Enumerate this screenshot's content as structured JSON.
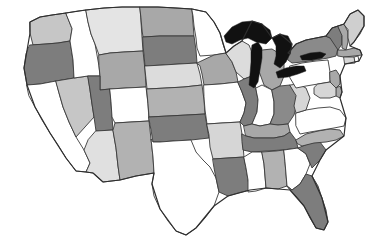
{
  "figure": {
    "background_color": "#ffffff",
    "border_color": "#3a3a3a"
  },
  "legend": {
    "shown": false,
    "shade_levels": [
      {
        "name": "white",
        "color": "#ffffff"
      },
      {
        "name": "light-gray",
        "color": "#e4e4e4"
      },
      {
        "name": "medium-light-gray",
        "color": "#c6c6c6"
      },
      {
        "name": "medium-gray",
        "color": "#a8a8a8"
      },
      {
        "name": "dark-gray",
        "color": "#7d7d7d"
      },
      {
        "name": "black",
        "color": "#111111"
      }
    ]
  },
  "chart_data": {
    "type": "choropleth",
    "subtitle": "",
    "xlabel": "",
    "ylabel": "",
    "grid": false,
    "legend_position": "none",
    "region_field": "state",
    "value_field": "shade",
    "categories": [
      "WA",
      "OR",
      "CA",
      "NV",
      "ID",
      "MT",
      "WY",
      "UT",
      "AZ",
      "CO",
      "NM",
      "ND",
      "SD",
      "NE",
      "KS",
      "OK",
      "TX",
      "MN",
      "IA",
      "MO",
      "AR",
      "LA",
      "WI",
      "IL",
      "MI",
      "IN",
      "OH",
      "KY",
      "TN",
      "MS",
      "AL",
      "GA",
      "FL",
      "SC",
      "NC",
      "VA",
      "WV",
      "PA",
      "NY",
      "VT",
      "NH",
      "ME",
      "MA",
      "RI",
      "CT",
      "NJ",
      "DE",
      "MD"
    ],
    "states": [
      {
        "code": "WA",
        "name": "Washington",
        "shade": "medium-light-gray",
        "color": "#c6c6c6"
      },
      {
        "code": "OR",
        "name": "Oregon",
        "shade": "dark-gray",
        "color": "#7d7d7d"
      },
      {
        "code": "CA",
        "name": "California",
        "shade": "white",
        "color": "#ffffff"
      },
      {
        "code": "NV",
        "name": "Nevada",
        "shade": "medium-light-gray",
        "color": "#c6c6c6"
      },
      {
        "code": "ID",
        "name": "Idaho",
        "shade": "white",
        "color": "#ffffff"
      },
      {
        "code": "MT",
        "name": "Montana",
        "shade": "light-gray",
        "color": "#e4e4e4"
      },
      {
        "code": "WY",
        "name": "Wyoming",
        "shade": "medium-gray",
        "color": "#a8a8a8"
      },
      {
        "code": "UT",
        "name": "Utah",
        "shade": "dark-gray",
        "color": "#7d7d7d"
      },
      {
        "code": "AZ",
        "name": "Arizona",
        "shade": "light-gray",
        "color": "#e0e0e0"
      },
      {
        "code": "CO",
        "name": "Colorado",
        "shade": "white",
        "color": "#ffffff"
      },
      {
        "code": "NM",
        "name": "New Mexico",
        "shade": "medium-gray",
        "color": "#b2b2b2"
      },
      {
        "code": "ND",
        "name": "North Dakota",
        "shade": "medium-gray",
        "color": "#a8a8a8"
      },
      {
        "code": "SD",
        "name": "South Dakota",
        "shade": "dark-gray",
        "color": "#7d7d7d"
      },
      {
        "code": "NE",
        "name": "Nebraska",
        "shade": "light-gray",
        "color": "#dcdcdc"
      },
      {
        "code": "KS",
        "name": "Kansas",
        "shade": "medium-gray",
        "color": "#b2b2b2"
      },
      {
        "code": "OK",
        "name": "Oklahoma",
        "shade": "dark-gray",
        "color": "#7d7d7d"
      },
      {
        "code": "TX",
        "name": "Texas",
        "shade": "white",
        "color": "#ffffff"
      },
      {
        "code": "MN",
        "name": "Minnesota",
        "shade": "white",
        "color": "#ffffff"
      },
      {
        "code": "IA",
        "name": "Iowa",
        "shade": "medium-gray",
        "color": "#a8a8a8"
      },
      {
        "code": "MO",
        "name": "Missouri",
        "shade": "white",
        "color": "#ffffff"
      },
      {
        "code": "AR",
        "name": "Arkansas",
        "shade": "light-gray",
        "color": "#d6d6d6"
      },
      {
        "code": "LA",
        "name": "Louisiana",
        "shade": "dark-gray",
        "color": "#7d7d7d"
      },
      {
        "code": "WI",
        "name": "Wisconsin",
        "shade": "light-gray",
        "color": "#dcdcdc"
      },
      {
        "code": "IL",
        "name": "Illinois",
        "shade": "dark-gray",
        "color": "#7d7d7d"
      },
      {
        "code": "MI",
        "name": "Michigan",
        "shade": "medium-gray",
        "color": "#a8a8a8"
      },
      {
        "code": "IN",
        "name": "Indiana",
        "shade": "white",
        "color": "#ffffff"
      },
      {
        "code": "OH",
        "name": "Ohio",
        "shade": "dark-gray",
        "color": "#8a8a8a"
      },
      {
        "code": "KY",
        "name": "Kentucky",
        "shade": "medium-gray",
        "color": "#a8a8a8"
      },
      {
        "code": "TN",
        "name": "Tennessee",
        "shade": "dark-gray",
        "color": "#7d7d7d"
      },
      {
        "code": "MS",
        "name": "Mississippi",
        "shade": "white",
        "color": "#ffffff"
      },
      {
        "code": "AL",
        "name": "Alabama",
        "shade": "medium-gray",
        "color": "#b2b2b2"
      },
      {
        "code": "GA",
        "name": "Georgia",
        "shade": "white",
        "color": "#ffffff"
      },
      {
        "code": "FL",
        "name": "Florida",
        "shade": "dark-gray",
        "color": "#7d7d7d"
      },
      {
        "code": "SC",
        "name": "South Carolina",
        "shade": "dark-gray",
        "color": "#7d7d7d"
      },
      {
        "code": "NC",
        "name": "North Carolina",
        "shade": "medium-gray",
        "color": "#b2b2b2"
      },
      {
        "code": "VA",
        "name": "Virginia",
        "shade": "white",
        "color": "#ffffff"
      },
      {
        "code": "WV",
        "name": "West Virginia",
        "shade": "light-gray",
        "color": "#d6d6d6"
      },
      {
        "code": "PA",
        "name": "Pennsylvania",
        "shade": "white",
        "color": "#ffffff"
      },
      {
        "code": "NY",
        "name": "New York",
        "shade": "dark-gray",
        "color": "#8a8a8a"
      },
      {
        "code": "VT",
        "name": "Vermont",
        "shade": "dark-gray",
        "color": "#7d7d7d"
      },
      {
        "code": "NH",
        "name": "New Hampshire",
        "shade": "medium-gray",
        "color": "#a8a8a8"
      },
      {
        "code": "ME",
        "name": "Maine",
        "shade": "light-gray",
        "color": "#cfcfcf"
      },
      {
        "code": "MA",
        "name": "Massachusetts",
        "shade": "medium-gray",
        "color": "#a8a8a8"
      },
      {
        "code": "RI",
        "name": "Rhode Island",
        "shade": "white",
        "color": "#ffffff"
      },
      {
        "code": "CT",
        "name": "Connecticut",
        "shade": "light-gray",
        "color": "#d6d6d6"
      },
      {
        "code": "NJ",
        "name": "New Jersey",
        "shade": "medium-gray",
        "color": "#a8a8a8"
      },
      {
        "code": "DE",
        "name": "Delaware",
        "shade": "medium-gray",
        "color": "#a8a8a8"
      },
      {
        "code": "MD",
        "name": "Maryland",
        "shade": "light-gray",
        "color": "#d6d6d6"
      }
    ],
    "water_bodies": [
      {
        "name": "Lake Superior",
        "color": "#111111"
      },
      {
        "name": "Lake Michigan",
        "color": "#111111"
      },
      {
        "name": "Lake Huron",
        "color": "#111111"
      },
      {
        "name": "Lake Erie",
        "color": "#111111"
      },
      {
        "name": "Lake Ontario",
        "color": "#111111"
      }
    ]
  }
}
